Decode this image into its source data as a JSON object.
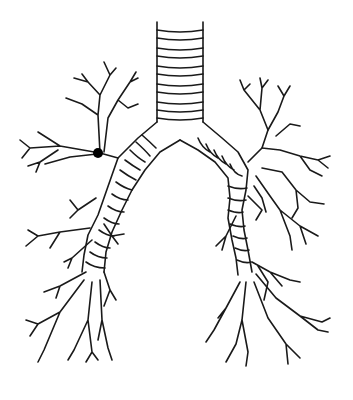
{
  "diagram": {
    "style": "black line art on white",
    "colors": {
      "background": "#ffffff",
      "stroke": "#1a1a1a",
      "marker": "#000000"
    },
    "trachea": {
      "x": 157,
      "top": 22,
      "bottom": 125,
      "width": 46,
      "rings": 10
    },
    "carina": {
      "x": 180,
      "y": 140
    },
    "main_bronchi": [
      {
        "side": "right-of-image-left",
        "from": [
          160,
          125
        ],
        "to": [
          120,
          175
        ]
      },
      {
        "side": "left-of-image-right",
        "from": [
          200,
          125
        ],
        "to": [
          245,
          180
        ]
      }
    ],
    "marker": {
      "shape": "dot",
      "x": 98,
      "y": 153,
      "r": 5
    }
  }
}
